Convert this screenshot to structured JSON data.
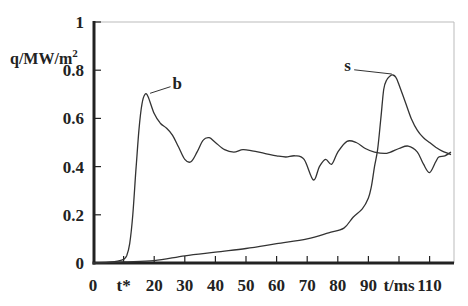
{
  "chart_data": {
    "type": "line",
    "title": "",
    "xlabel": "t/ms",
    "ylabel": "q/MW/m²",
    "xlim": [
      0,
      118
    ],
    "ylim": [
      0,
      1
    ],
    "grid": false,
    "legend": "inline labels",
    "x_ticks": [
      {
        "value": 0,
        "label": "0"
      },
      {
        "value": 10,
        "label": "t*"
      },
      {
        "value": 20,
        "label": "20"
      },
      {
        "value": 30,
        "label": "30"
      },
      {
        "value": 40,
        "label": "40"
      },
      {
        "value": 50,
        "label": "50"
      },
      {
        "value": 60,
        "label": "60"
      },
      {
        "value": 70,
        "label": "70"
      },
      {
        "value": 80,
        "label": "80"
      },
      {
        "value": 90,
        "label": "90"
      },
      {
        "value": 100,
        "label": "t/ms"
      },
      {
        "value": 110,
        "label": "110"
      }
    ],
    "y_ticks": [
      {
        "value": 0,
        "label": "0"
      },
      {
        "value": 0.2,
        "label": "0.2"
      },
      {
        "value": 0.4,
        "label": "0.4"
      },
      {
        "value": 0.6,
        "label": "0.6"
      },
      {
        "value": 0.8,
        "label": "0.8"
      },
      {
        "value": 1,
        "label": "1"
      }
    ],
    "series": [
      {
        "name": "b",
        "x": [
          0,
          5,
          8,
          10,
          11,
          12,
          13,
          14,
          15,
          16,
          17,
          18,
          20,
          22,
          24,
          26,
          28,
          30,
          32,
          34,
          36,
          38,
          40,
          43,
          46,
          49,
          52,
          56,
          60,
          63,
          66,
          69,
          72,
          74,
          76,
          78,
          80,
          83,
          86,
          89,
          92,
          96,
          100,
          103,
          106,
          108,
          110,
          112,
          113,
          115,
          117
        ],
        "values": [
          0,
          0.003,
          0.008,
          0.015,
          0.03,
          0.08,
          0.2,
          0.38,
          0.55,
          0.66,
          0.7,
          0.69,
          0.62,
          0.58,
          0.56,
          0.53,
          0.48,
          0.43,
          0.42,
          0.46,
          0.51,
          0.52,
          0.5,
          0.47,
          0.46,
          0.47,
          0.465,
          0.455,
          0.445,
          0.44,
          0.445,
          0.43,
          0.345,
          0.4,
          0.43,
          0.41,
          0.46,
          0.505,
          0.5,
          0.475,
          0.46,
          0.455,
          0.475,
          0.485,
          0.46,
          0.41,
          0.375,
          0.42,
          0.44,
          0.445,
          0.46
        ]
      },
      {
        "name": "s",
        "x": [
          0,
          10,
          20,
          30,
          40,
          50,
          60,
          70,
          77,
          82,
          85,
          88,
          90,
          91,
          92,
          93,
          94,
          95,
          96,
          97,
          98,
          99,
          100,
          102,
          104,
          106,
          108,
          110,
          112,
          114,
          117
        ],
        "values": [
          0,
          0.005,
          0.01,
          0.03,
          0.045,
          0.06,
          0.08,
          0.1,
          0.125,
          0.145,
          0.19,
          0.225,
          0.27,
          0.32,
          0.4,
          0.47,
          0.59,
          0.72,
          0.76,
          0.775,
          0.78,
          0.77,
          0.74,
          0.67,
          0.6,
          0.55,
          0.52,
          0.5,
          0.48,
          0.465,
          0.45
        ]
      }
    ],
    "annotations": [
      {
        "text": "b",
        "x": 26,
        "y": 0.74,
        "points_to": [
          18,
          0.7
        ]
      },
      {
        "text": "s",
        "x": 86,
        "y": 0.81,
        "points_to": [
          97,
          0.78
        ]
      }
    ]
  }
}
